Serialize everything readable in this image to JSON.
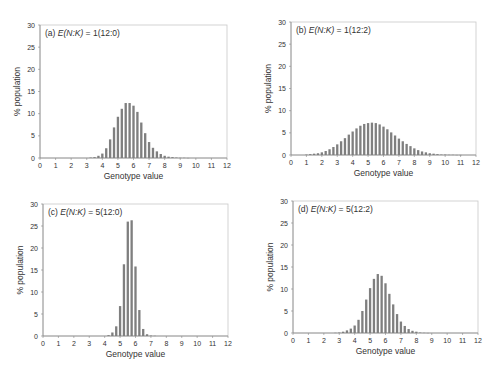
{
  "chart_data": [
    {
      "type": "bar",
      "panel": "a",
      "title": "(a) E(N:K) = 1(12:0)",
      "title_prefix": "(a) ",
      "title_italic": "E(N:K)",
      "title_suffix": " = 1(12:0)",
      "xlabel": "Genotype value",
      "ylabel": "% population",
      "xlim": [
        0,
        12
      ],
      "ylim": [
        0,
        30
      ],
      "xticks": [
        0,
        1,
        2,
        3,
        4,
        5,
        6,
        7,
        8,
        9,
        10,
        11,
        12
      ],
      "yticks": [
        0,
        5,
        10,
        15,
        20,
        25,
        30
      ],
      "x": [
        3.25,
        3.5,
        3.75,
        4.0,
        4.25,
        4.5,
        4.75,
        5.0,
        5.25,
        5.5,
        5.75,
        6.0,
        6.25,
        6.5,
        6.75,
        7.0,
        7.25,
        7.5,
        7.75,
        8.0,
        8.25,
        8.5,
        8.75,
        9.0,
        9.25,
        9.5
      ],
      "values": [
        0.1,
        0.2,
        0.5,
        1.0,
        2.2,
        4.2,
        6.9,
        9.3,
        11.1,
        12.4,
        12.4,
        11.8,
        10.4,
        8.0,
        5.6,
        3.6,
        2.3,
        1.5,
        0.9,
        0.5,
        0.3,
        0.2,
        0.1,
        0.05,
        0.05,
        0.02
      ]
    },
    {
      "type": "bar",
      "panel": "b",
      "title": "(b) E(N:K) = 1(12:2)",
      "title_prefix": "(b) ",
      "title_italic": "E(N:K)",
      "title_suffix": " = 1(12:2)",
      "xlabel": "Genotype value",
      "ylabel": "% population",
      "xlim": [
        0,
        12
      ],
      "ylim": [
        0,
        30
      ],
      "xticks": [
        0,
        1,
        2,
        3,
        4,
        5,
        6,
        7,
        8,
        9,
        10,
        11,
        12
      ],
      "yticks": [
        0,
        5,
        10,
        15,
        20,
        25,
        30
      ],
      "x": [
        1.0,
        1.25,
        1.5,
        1.75,
        2.0,
        2.25,
        2.5,
        2.75,
        3.0,
        3.25,
        3.5,
        3.75,
        4.0,
        4.25,
        4.5,
        4.75,
        5.0,
        5.25,
        5.5,
        5.75,
        6.0,
        6.25,
        6.5,
        6.75,
        7.0,
        7.25,
        7.5,
        7.75,
        8.0,
        8.25,
        8.5,
        8.75,
        9.0,
        9.25,
        9.5,
        9.75,
        10.0,
        10.25,
        10.5,
        10.75,
        11.0
      ],
      "values": [
        0.1,
        0.2,
        0.3,
        0.4,
        0.6,
        0.9,
        1.3,
        1.8,
        2.4,
        3.1,
        3.8,
        4.6,
        5.3,
        6.0,
        6.6,
        7.0,
        7.2,
        7.3,
        7.2,
        6.9,
        6.4,
        5.8,
        5.1,
        4.4,
        3.7,
        3.1,
        2.5,
        2.0,
        1.5,
        1.1,
        0.8,
        0.6,
        0.4,
        0.3,
        0.2,
        0.1,
        0.1,
        0.05,
        0.05,
        0.02,
        0.02
      ]
    },
    {
      "type": "bar",
      "panel": "c",
      "title": "(c) E(N:K) = 5(12:0)",
      "title_prefix": "(c) ",
      "title_italic": "E(N:K)",
      "title_suffix": " = 5(12:0)",
      "xlabel": "Genotype value",
      "ylabel": "% population",
      "xlim": [
        0,
        12
      ],
      "ylim": [
        0,
        30
      ],
      "xticks": [
        0,
        1,
        2,
        3,
        4,
        5,
        6,
        7,
        8,
        9,
        10,
        11,
        12
      ],
      "yticks": [
        0,
        5,
        10,
        15,
        20,
        25,
        30
      ],
      "x": [
        4.25,
        4.5,
        4.75,
        5.0,
        5.25,
        5.5,
        5.75,
        6.0,
        6.25,
        6.5,
        6.75,
        7.0,
        7.25
      ],
      "values": [
        0.2,
        0.8,
        2.2,
        6.8,
        16.3,
        26.0,
        26.3,
        15.8,
        5.9,
        1.6,
        0.4,
        0.1,
        0.05
      ]
    },
    {
      "type": "bar",
      "panel": "d",
      "title": "(d) E(N:K) = 5(12:2)",
      "title_prefix": "(d) ",
      "title_italic": "E(N:K)",
      "title_suffix": " = 5(12:2)",
      "xlabel": "Genotype value",
      "ylabel": "% population",
      "xlim": [
        0,
        12
      ],
      "ylim": [
        0,
        30
      ],
      "xticks": [
        0,
        1,
        2,
        3,
        4,
        5,
        6,
        7,
        8,
        9,
        10,
        11,
        12
      ],
      "yticks": [
        0,
        5,
        10,
        15,
        20,
        25,
        30
      ],
      "x": [
        2.75,
        3.0,
        3.25,
        3.5,
        3.75,
        4.0,
        4.25,
        4.5,
        4.75,
        5.0,
        5.25,
        5.5,
        5.75,
        6.0,
        6.25,
        6.5,
        6.75,
        7.0,
        7.25,
        7.5,
        7.75,
        8.0,
        8.25,
        8.5,
        8.75
      ],
      "values": [
        0.05,
        0.1,
        0.3,
        0.6,
        1.0,
        1.7,
        3.0,
        5.0,
        7.6,
        10.2,
        12.3,
        13.4,
        13.0,
        11.3,
        8.9,
        6.5,
        4.3,
        2.6,
        1.6,
        0.9,
        0.5,
        0.3,
        0.1,
        0.05,
        0.02
      ]
    }
  ],
  "layout": {
    "panels": [
      {
        "left": 40,
        "top": 25,
        "width": 187,
        "height": 133
      },
      {
        "left": 291,
        "top": 22,
        "width": 185,
        "height": 133
      },
      {
        "left": 43,
        "top": 204,
        "width": 185,
        "height": 132
      },
      {
        "left": 293,
        "top": 201,
        "width": 185,
        "height": 132
      }
    ],
    "bar_color": "#7f7f7f",
    "axis_color": "#888888",
    "text_color": "#333333"
  }
}
